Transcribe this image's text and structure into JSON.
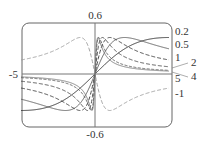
{
  "chart_data": {
    "type": "line",
    "title": "",
    "xlabel": "",
    "ylabel": "",
    "function": "f(x) = c*x / (1 + c^2 * x^2)",
    "xlim": [
      -5,
      5
    ],
    "ylim": [
      -0.6,
      0.6
    ],
    "grid": false,
    "x_tick_labels": [
      "-5",
      "5"
    ],
    "y_tick_labels": [
      "0.6",
      "-0.6"
    ],
    "series": [
      {
        "name": "0.2",
        "c": 0.2,
        "style": "solid",
        "color": "#222222"
      },
      {
        "name": "0.5",
        "c": 0.5,
        "style": "solid",
        "color": "#555555"
      },
      {
        "name": "1",
        "c": 1,
        "style": "dashed",
        "color": "#333333"
      },
      {
        "name": "2",
        "c": 2,
        "style": "dashed",
        "color": "#444444"
      },
      {
        "name": "4",
        "c": 4,
        "style": "dotted-dash",
        "color": "#555555"
      },
      {
        "name": "5",
        "c": 5,
        "style": "solid",
        "color": "#777777"
      },
      {
        "name": "-1",
        "c": -1,
        "style": "dashed",
        "color": "#999999"
      }
    ]
  },
  "labels": {
    "y_top": "0.6",
    "y_bottom": "-0.6",
    "x_left": "-5",
    "x_right": "5",
    "series": [
      "0.2",
      "0.5",
      "1",
      "2",
      "4",
      "5",
      "-1"
    ]
  }
}
